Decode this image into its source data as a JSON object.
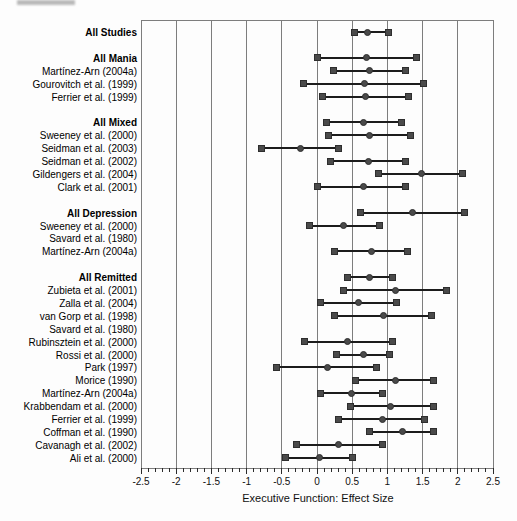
{
  "chart_data": {
    "type": "forest",
    "title": "",
    "xlabel": "Executive Function: Effect Size",
    "xlim": [
      -2.5,
      2.5
    ],
    "x_major_ticks": [
      -2.5,
      -2,
      -1.5,
      -1,
      -0.5,
      0,
      0.5,
      1,
      1.5,
      2,
      2.5
    ],
    "x_tick_labels": [
      "-2.5",
      "-2",
      "-1.5",
      "-1",
      "-0.5",
      "0",
      "0.5",
      "1",
      "1.5",
      "2",
      "2.5"
    ],
    "x_minor_tick_step": 0.1,
    "grid": "vertical gridlines at every major tick",
    "legend": "none",
    "marker_shapes": {
      "ci_ends": "square",
      "mean": "circle"
    },
    "colors": {
      "marker": "#4a4a4a",
      "marker_edge": "#2e2e2e",
      "ci_line": "#1c1c1c",
      "grid": "#7d7d7d",
      "text": "#000000",
      "background": "#fdfdfd"
    },
    "groups": [
      {
        "header": {
          "label": "All Studies",
          "lo": 0.53,
          "mean": 0.72,
          "hi": 1.01
        },
        "studies": []
      },
      {
        "header": {
          "label": "All Mania",
          "lo": 0.0,
          "mean": 0.71,
          "hi": 1.41
        },
        "studies": [
          {
            "label": "Martínez-Arn (2004a)",
            "lo": 0.23,
            "mean": 0.74,
            "hi": 1.25
          },
          {
            "label": "Gourovitch et al. (1999)",
            "lo": -0.19,
            "mean": 0.67,
            "hi": 1.51
          },
          {
            "label": "Ferrier et al. (1999)",
            "lo": 0.08,
            "mean": 0.69,
            "hi": 1.3
          }
        ]
      },
      {
        "header": {
          "label": "All Mixed",
          "lo": 0.14,
          "mean": 0.66,
          "hi": 1.2
        },
        "studies": [
          {
            "label": "Sweeney et al. (2000)",
            "lo": 0.17,
            "mean": 0.74,
            "hi": 1.33
          },
          {
            "label": "Seidman et al. (2003)",
            "lo": -0.79,
            "mean": -0.23,
            "hi": 0.31
          },
          {
            "label": "Seidman et al. (2002)",
            "lo": 0.19,
            "mean": 0.73,
            "hi": 1.25
          },
          {
            "label": "Gildengers et al. (2004)",
            "lo": 0.88,
            "mean": 1.48,
            "hi": 2.07
          },
          {
            "label": "Clark et al. (2001)",
            "lo": 0.01,
            "mean": 0.66,
            "hi": 1.26
          }
        ]
      },
      {
        "header": {
          "label": "All Depression",
          "lo": 0.62,
          "mean": 1.35,
          "hi": 2.1
        },
        "studies": [
          {
            "label": "Sweeney et al. (2000)",
            "lo": -0.11,
            "mean": 0.38,
            "hi": 0.89
          },
          {
            "label": "Savard et al. (1980)",
            "lo": null,
            "mean": null,
            "hi": null
          },
          {
            "label": "Martínez-Arn (2004a)",
            "lo": 0.25,
            "mean": 0.78,
            "hi": 1.29
          }
        ]
      },
      {
        "header": {
          "label": "All Remitted",
          "lo": 0.44,
          "mean": 0.75,
          "hi": 1.07
        },
        "studies": [
          {
            "label": "Zubieta et al. (2001)",
            "lo": 0.37,
            "mean": 1.11,
            "hi": 1.84
          },
          {
            "label": "Zalla et al. (2004)",
            "lo": 0.05,
            "mean": 0.59,
            "hi": 1.13
          },
          {
            "label": "van Gorp et al. (1998)",
            "lo": 0.25,
            "mean": 0.95,
            "hi": 1.63
          },
          {
            "label": "Savard et al. (1980)",
            "lo": null,
            "mean": null,
            "hi": null
          },
          {
            "label": "Rubinsztein et al. (2000)",
            "lo": -0.18,
            "mean": 0.44,
            "hi": 1.07
          },
          {
            "label": "Rossi et al. (2000)",
            "lo": 0.28,
            "mean": 0.66,
            "hi": 1.03
          },
          {
            "label": "Park (1997)",
            "lo": -0.57,
            "mean": 0.15,
            "hi": 0.84
          },
          {
            "label": "Morice (1990)",
            "lo": 0.54,
            "mean": 1.11,
            "hi": 1.65
          },
          {
            "label": "Martínez-Arn (2004a)",
            "lo": 0.05,
            "mean": 0.49,
            "hi": 0.93
          },
          {
            "label": "Krabbendam et al. (2000)",
            "lo": 0.47,
            "mean": 1.04,
            "hi": 1.66
          },
          {
            "label": "Ferrier et al. (1999)",
            "lo": 0.3,
            "mean": 0.93,
            "hi": 1.52
          },
          {
            "label": "Coffman et al. (1990)",
            "lo": 0.75,
            "mean": 1.21,
            "hi": 1.66
          },
          {
            "label": "Cavanagh et al. (2002)",
            "lo": -0.29,
            "mean": 0.31,
            "hi": 0.93
          },
          {
            "label": "Ali et al. (2000)",
            "lo": -0.45,
            "mean": 0.04,
            "hi": 0.5
          }
        ]
      }
    ]
  }
}
